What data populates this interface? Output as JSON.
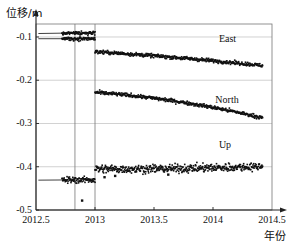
{
  "chart_data": {
    "type": "scatter",
    "title": "",
    "xlabel": "年份",
    "ylabel": "位移/m",
    "xlim": [
      2012.5,
      2014.5
    ],
    "ylim": [
      -0.5,
      -0.07
    ],
    "grid": true,
    "legend_position": "inline-right",
    "y_ticks": [
      -0.1,
      -0.2,
      -0.3,
      -0.4,
      -0.5
    ],
    "y_tick_labels": [
      "-0.1",
      "-0.2",
      "-0.3",
      "-0.4",
      "-0.5"
    ],
    "x_ticks": [
      2012.5,
      2013,
      2013.5,
      2014,
      2014.5
    ],
    "x_tick_labels": [
      "2012.5",
      "2013",
      "2013.5",
      "2014",
      "2014.5"
    ],
    "event_lines": [
      2012.83,
      2013.0
    ],
    "point_color": "#111111",
    "gridline_color": "#bdbdbd",
    "axis_color": "#555555",
    "series": [
      {
        "name": "East",
        "label": "East",
        "label_x": 2014.05,
        "label_y": -0.108,
        "pre_event": {
          "x_start": 2012.52,
          "x_end": 2013.0,
          "y_start": -0.092,
          "y_end": -0.09,
          "scatter": 0.004,
          "dense_from": 2012.72
        },
        "post_event": {
          "x_start": 2013.0,
          "x_end": 2014.42,
          "y_start": -0.134,
          "y_end": -0.166,
          "scatter": 0.004,
          "curvature": 0.004
        },
        "offset_at_2013": -0.044
      },
      {
        "name": "North",
        "label": "North",
        "label_x": 2014.02,
        "label_y": -0.247,
        "pre_event": {
          "x_start": 2012.52,
          "x_end": 2013.0,
          "y_start": -0.104,
          "y_end": -0.104,
          "scatter": 0.004,
          "dense_from": 2012.72
        },
        "post_event": {
          "x_start": 2013.0,
          "x_end": 2014.42,
          "y_start": -0.228,
          "y_end": -0.287,
          "scatter": 0.004,
          "curvature": 0.016
        },
        "offset_at_2013": -0.124
      },
      {
        "name": "Up",
        "label": "Up",
        "label_x": 2014.05,
        "label_y": -0.352,
        "pre_event": {
          "x_start": 2012.52,
          "x_end": 2013.0,
          "y_start": -0.431,
          "y_end": -0.43,
          "scatter": 0.007,
          "dense_from": 2012.72
        },
        "post_event": {
          "x_start": 2013.0,
          "x_end": 2014.42,
          "y_start": -0.405,
          "y_end": -0.399,
          "scatter": 0.009,
          "curvature": -0.004
        },
        "offset_at_2013": 0.026,
        "outliers": [
          {
            "x": 2012.89,
            "y": -0.478
          },
          {
            "x": 2013.08,
            "y": -0.424
          },
          {
            "x": 2013.17,
            "y": -0.421
          },
          {
            "x": 2013.62,
            "y": -0.418
          }
        ]
      }
    ]
  },
  "axes": {
    "y_axis_title": "位移/m",
    "x_axis_title": "年份"
  },
  "series_labels": {
    "east": "East",
    "north": "North",
    "up": "Up"
  }
}
